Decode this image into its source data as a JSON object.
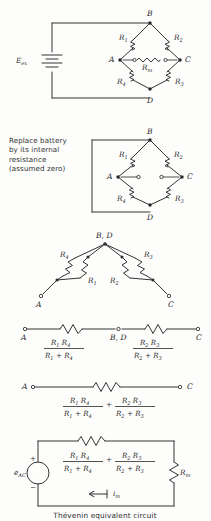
{
  "figure": {
    "caption": "Thévenin equivalent circuit",
    "note": "Replace battery\nby its internal\nresistance\n(assumed zero)"
  },
  "symbols": {
    "R1": "R",
    "R1_sub": "1",
    "R2": "R",
    "R2_sub": "2",
    "R3": "R",
    "R3_sub": "3",
    "R4": "R",
    "R4_sub": "4",
    "Rm": "R",
    "Rm_sub": "m",
    "Eex": "E",
    "Eex_sub": "ex",
    "eAC": "e",
    "eAC_sub": "AC",
    "im": "i",
    "im_sub": "m",
    "plus": "+",
    "minus": "−",
    "plus_op": "+"
  },
  "nodes": {
    "A": "A",
    "B": "B",
    "C": "C",
    "D": "D",
    "BD": "B, D"
  },
  "panels": [
    {
      "id": "panel-bridge-energized",
      "name": "wheatstone-bridge-with-source",
      "description": "Wheatstone bridge driven by excitation battery with meter Rm across A-C"
    },
    {
      "id": "panel-bridge-shorted",
      "name": "wheatstone-bridge-battery-replaced",
      "description": "Bridge with battery replaced by short, meter removed leaving open terminals"
    },
    {
      "id": "panel-bridge-folded",
      "name": "bridge-redrawn-parallel-pairs",
      "description": "Redrawn network with B and D merged, R1 parallel R4 and R2 parallel R3"
    },
    {
      "id": "panel-series-pair",
      "name": "series-equivalent-two-resistors",
      "description": "A to B,D to C series chain of the two parallel combinations"
    },
    {
      "id": "panel-series-sum",
      "name": "series-equivalent-single-resistor",
      "description": "A to C single equivalent resistance as sum of parallel combinations"
    },
    {
      "id": "panel-thevenin",
      "name": "thevenin-equivalent-circuit",
      "description": "Thevenin source eAC with equivalent resistance feeding meter Rm, current im"
    }
  ]
}
